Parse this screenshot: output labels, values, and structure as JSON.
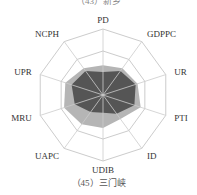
{
  "top_caption": "（43）新乡",
  "bottom_caption": "（45）三门峡",
  "chart_data": {
    "type": "radar",
    "title": "（45）三门峡",
    "axes": [
      "PD",
      "GDPPC",
      "UR",
      "PTI",
      "ID",
      "UDIB",
      "UAPC",
      "MRU",
      "UPR",
      "NCPH"
    ],
    "range": [
      0,
      1
    ],
    "rings": 3,
    "grid": true,
    "series": [
      {
        "name": "light",
        "color": "#b5b5b5",
        "values": [
          0.45,
          0.5,
          0.55,
          0.6,
          0.45,
          0.5,
          0.55,
          0.62,
          0.6,
          0.5
        ]
      },
      {
        "name": "dark",
        "color": "#555555",
        "values": [
          0.35,
          0.45,
          0.52,
          0.5,
          0.35,
          0.27,
          0.32,
          0.45,
          0.5,
          0.45
        ]
      }
    ]
  },
  "colors": {
    "grid": "#cccccc",
    "light": "#b5b5b5",
    "dark": "#595959"
  }
}
